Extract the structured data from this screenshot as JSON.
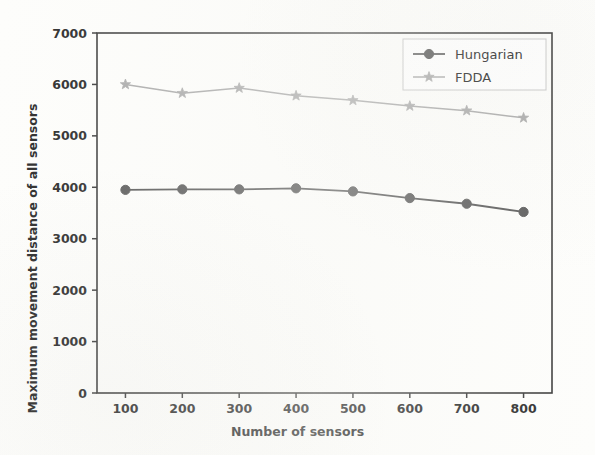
{
  "chart_data": {
    "type": "line",
    "title": "",
    "xlabel": "Number of sensors",
    "ylabel": "Maximum movement distance of all sensors",
    "x": [
      100,
      200,
      300,
      400,
      500,
      600,
      700,
      800
    ],
    "xticklabels": [
      "100",
      "200",
      "300",
      "400",
      "500",
      "600",
      "700",
      "800"
    ],
    "yticks": [
      0,
      1000,
      2000,
      3000,
      4000,
      5000,
      6000,
      7000
    ],
    "yticklabels": [
      "0",
      "1000",
      "2000",
      "3000",
      "4000",
      "5000",
      "6000",
      "7000"
    ],
    "xlim": [
      50,
      850
    ],
    "ylim": [
      0,
      7000
    ],
    "grid": false,
    "legend_position": "upper right",
    "series": [
      {
        "name": "Hungarian",
        "marker": "circle",
        "color": "#575757",
        "values": [
          3950,
          3960,
          3960,
          3980,
          3920,
          3790,
          3680,
          3520
        ]
      },
      {
        "name": "FDDA",
        "marker": "star",
        "color": "#a9a9a9",
        "values": [
          6000,
          5830,
          5930,
          5780,
          5690,
          5580,
          5490,
          5350
        ]
      }
    ]
  },
  "legend": {
    "entries": [
      {
        "label": "Hungarian"
      },
      {
        "label": "FDDA"
      }
    ]
  },
  "colors": {
    "axis": "#3a3a3a",
    "text": "#2b2b2b",
    "series_hungarian": "#575757",
    "series_fdda": "#a9a9a9",
    "background": "#fdfdfb"
  }
}
